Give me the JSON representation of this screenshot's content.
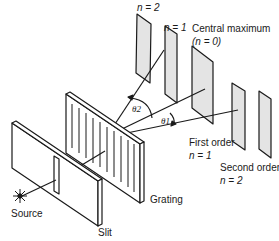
{
  "diagram": {
    "labels": {
      "n2_top": "n = 2",
      "n1_top": "n = 1",
      "central_max": "Central maximum",
      "central_max_n": "(n = 0)",
      "first_order": "First order",
      "first_order_n": "n = 1",
      "second_order": "Second order",
      "second_order_n": "n = 2",
      "grating": "Grating",
      "source": "Source",
      "slit": "Slit",
      "theta2": "θ2",
      "theta1": "θ1"
    },
    "colors": {
      "line": "#1a1a1a",
      "screen_fill": "#e4e4e4",
      "background": "#ffffff"
    }
  }
}
